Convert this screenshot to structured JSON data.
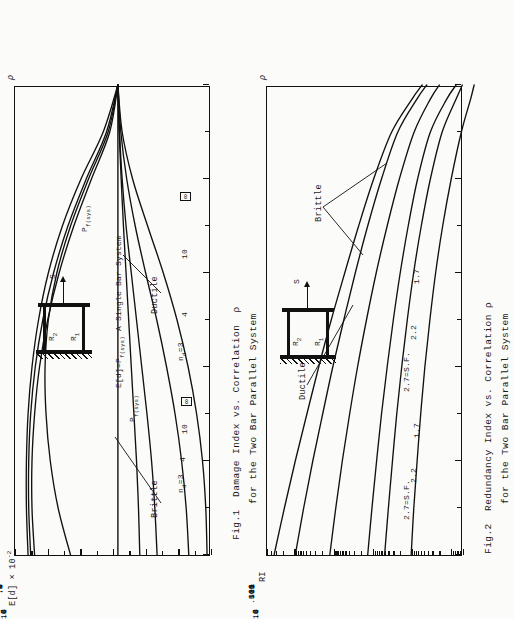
{
  "page": {
    "background_color": "#fbfbf9",
    "ink_color": "#111111",
    "orientation_note": "landscape-scan-rotated"
  },
  "fig1": {
    "caption_line1": "Fig.1  Damage Index vs. Correlation  ρ",
    "caption_line2": "for the Two Bar Parallel System",
    "y_axis_title": "E[d] × 10",
    "y_axis_exponent": "-2",
    "x_axis_title": "ρ",
    "y_ticks": [
      ".6",
      ".5",
      ".4",
      ".3",
      ".2",
      ".1",
      ".0"
    ],
    "x_ticks": [
      ".0",
      ".2",
      ".4",
      ".6",
      ".8",
      "1."
    ],
    "annotations": {
      "brittle": "Brittle",
      "ductile": "Ductile",
      "pf_sys": "P",
      "pf_sys_sub": "f(sys)",
      "single_bar": "E[d]=P",
      "single_bar_sub": "f(sys)",
      "single_bar_tail": "  A Single Bar System"
    },
    "curve_labels_upper": [
      "n",
      "4",
      "10",
      "∞"
    ],
    "curve_label_upper_first_sub": "d",
    "curve_label_upper_first_val": "=3",
    "curve_labels_lower": [
      "n",
      "4",
      "10",
      "∞"
    ],
    "curve_label_lower_first_sub": "d",
    "curve_label_lower_first_val": "=3"
  },
  "fig2": {
    "caption_line1": "Fig.2  Redundancy Index vs. Correlation ρ",
    "caption_line2": "for the Two Bar Parallel System",
    "y_axis_title": "RI",
    "x_axis_title": "ρ",
    "y_ticks": [
      "500",
      "100",
      "10",
      "1",
      ".1",
      ".01",
      ".005"
    ],
    "x_ticks": [
      ".0",
      ".2",
      ".4",
      ".6",
      ".8",
      "1."
    ],
    "annotations": {
      "brittle": "Brittle",
      "ductile": "Ductile"
    },
    "curve_labels_upper": [
      "2.7=S.F.",
      "2.2",
      "1.7"
    ],
    "curve_labels_lower": [
      "2.7=S.F.",
      "2.2",
      "1.7"
    ]
  },
  "sketch": {
    "label_r1": "R",
    "label_r1_sub": "1",
    "label_r2": "R",
    "label_r2_sub": "2",
    "label_s": "S"
  },
  "chart_data": [
    {
      "type": "line",
      "id": "fig1",
      "title": "Damage Index vs. Correlation ρ for the Two Bar Parallel System",
      "xlabel": "ρ",
      "ylabel": "E[d] × 10^-2",
      "xlim": [
        0.0,
        1.0
      ],
      "ylim": [
        0.0,
        0.6
      ],
      "grid": false,
      "legend": "inline-labels",
      "xticks": [
        0.0,
        0.2,
        0.4,
        0.6,
        0.8,
        1.0
      ],
      "yticks": [
        0.0,
        0.1,
        0.2,
        0.3,
        0.4,
        0.5,
        0.6
      ],
      "reference_line": {
        "label": "E[d]=P_f(sys)  A Single Bar System",
        "y": 0.285
      },
      "series": [
        {
          "name": "Brittle n_d=3",
          "group": "brittle",
          "x": [
            0.0,
            0.1,
            0.2,
            0.3,
            0.4,
            0.5,
            0.6,
            0.7,
            0.8,
            0.9,
            1.0
          ],
          "y": [
            0.56,
            0.565,
            0.565,
            0.56,
            0.548,
            0.528,
            0.498,
            0.455,
            0.398,
            0.33,
            0.285
          ]
        },
        {
          "name": "Brittle n_d=4",
          "group": "brittle",
          "x": [
            0.0,
            0.1,
            0.2,
            0.3,
            0.4,
            0.5,
            0.6,
            0.7,
            0.8,
            0.9,
            1.0
          ],
          "y": [
            0.552,
            0.558,
            0.558,
            0.552,
            0.538,
            0.515,
            0.482,
            0.438,
            0.382,
            0.32,
            0.285
          ]
        },
        {
          "name": "Brittle n_d=10",
          "group": "brittle",
          "x": [
            0.0,
            0.1,
            0.2,
            0.3,
            0.4,
            0.5,
            0.6,
            0.7,
            0.8,
            0.9,
            1.0
          ],
          "y": [
            0.54,
            0.548,
            0.548,
            0.54,
            0.525,
            0.5,
            0.465,
            0.42,
            0.366,
            0.31,
            0.285
          ]
        },
        {
          "name": "Brittle n_d=∞",
          "group": "brittle",
          "x": [
            0.0,
            0.1,
            0.2,
            0.3,
            0.4,
            0.5,
            0.6,
            0.7,
            0.8,
            0.9,
            1.0
          ],
          "y": [
            0.43,
            0.468,
            0.492,
            0.505,
            0.508,
            0.498,
            0.472,
            0.43,
            0.375,
            0.315,
            0.285
          ]
        },
        {
          "name": "Ductile n_d=3",
          "group": "ductile",
          "x": [
            0.0,
            0.1,
            0.2,
            0.3,
            0.4,
            0.5,
            0.6,
            0.7,
            0.8,
            0.9,
            1.0
          ],
          "y": [
            0.218,
            0.222,
            0.228,
            0.236,
            0.244,
            0.252,
            0.26,
            0.268,
            0.275,
            0.281,
            0.285
          ]
        },
        {
          "name": "Ductile n_d=4",
          "group": "ductile",
          "x": [
            0.0,
            0.1,
            0.2,
            0.3,
            0.4,
            0.5,
            0.6,
            0.7,
            0.8,
            0.9,
            1.0
          ],
          "y": [
            0.165,
            0.172,
            0.182,
            0.196,
            0.212,
            0.228,
            0.244,
            0.26,
            0.272,
            0.28,
            0.285
          ]
        },
        {
          "name": "Ductile n_d=10",
          "group": "ductile",
          "x": [
            0.0,
            0.1,
            0.2,
            0.3,
            0.4,
            0.5,
            0.6,
            0.7,
            0.8,
            0.9,
            1.0
          ],
          "y": [
            0.068,
            0.076,
            0.09,
            0.11,
            0.136,
            0.166,
            0.2,
            0.232,
            0.258,
            0.276,
            0.285
          ]
        },
        {
          "name": "Ductile n_d=∞",
          "group": "ductile",
          "x": [
            0.0,
            0.1,
            0.2,
            0.3,
            0.4,
            0.5,
            0.6,
            0.7,
            0.8,
            0.9,
            1.0
          ],
          "y": [
            0.012,
            0.016,
            0.026,
            0.044,
            0.07,
            0.104,
            0.146,
            0.194,
            0.24,
            0.272,
            0.285
          ]
        }
      ]
    },
    {
      "type": "line",
      "id": "fig2",
      "title": "Redundancy Index vs. Correlation ρ for the Two Bar Parallel System",
      "xlabel": "ρ",
      "ylabel": "RI",
      "yscale": "log",
      "xlim": [
        0.0,
        1.0
      ],
      "ylim": [
        0.005,
        500
      ],
      "grid": false,
      "legend": "inline-labels",
      "xticks": [
        0.0,
        0.2,
        0.4,
        0.6,
        0.8,
        1.0
      ],
      "yticks": [
        0.005,
        0.01,
        0.1,
        1,
        10,
        100,
        500
      ],
      "series": [
        {
          "name": "Ductile 2.7=S.F.",
          "group": "ductile",
          "x": [
            0.0,
            0.1,
            0.2,
            0.3,
            0.4,
            0.5,
            0.6,
            0.7,
            0.8,
            0.9,
            0.97,
            1.0
          ],
          "y": [
            330,
            180,
            95,
            48,
            24,
            11.5,
            5.2,
            2.3,
            0.95,
            0.33,
            0.1,
            0.055
          ]
        },
        {
          "name": "Ductile 2.2",
          "group": "ductile",
          "x": [
            0.0,
            0.1,
            0.2,
            0.3,
            0.4,
            0.5,
            0.6,
            0.7,
            0.8,
            0.9,
            0.97,
            1.0
          ],
          "y": [
            95,
            58,
            34,
            19,
            10.5,
            5.5,
            2.8,
            1.35,
            0.6,
            0.23,
            0.075,
            0.042
          ]
        },
        {
          "name": "Ductile 1.7",
          "group": "ductile",
          "x": [
            0.0,
            0.1,
            0.2,
            0.3,
            0.4,
            0.5,
            0.6,
            0.7,
            0.8,
            0.9,
            0.97,
            1.0
          ],
          "y": [
            12.5,
            8.8,
            6.0,
            3.9,
            2.45,
            1.45,
            0.82,
            0.43,
            0.21,
            0.088,
            0.034,
            0.02
          ]
        },
        {
          "name": "Brittle 2.7=S.F.",
          "group": "brittle",
          "x": [
            0.0,
            0.1,
            0.2,
            0.3,
            0.4,
            0.5,
            0.6,
            0.7,
            0.8,
            0.9,
            0.97,
            1.0
          ],
          "y": [
            1.35,
            1.05,
            0.8,
            0.6,
            0.43,
            0.3,
            0.2,
            0.125,
            0.072,
            0.034,
            0.013,
            0.0075
          ]
        },
        {
          "name": "Brittle 2.2",
          "group": "brittle",
          "x": [
            0.0,
            0.1,
            0.2,
            0.3,
            0.4,
            0.5,
            0.6,
            0.7,
            0.8,
            0.9,
            0.97,
            1.0
          ],
          "y": [
            0.5,
            0.4,
            0.315,
            0.245,
            0.183,
            0.132,
            0.091,
            0.058,
            0.034,
            0.017,
            0.0075,
            0.0052
          ]
        },
        {
          "name": "Brittle 1.7",
          "group": "brittle",
          "x": [
            0.0,
            0.1,
            0.2,
            0.3,
            0.4,
            0.5,
            0.6,
            0.7,
            0.8,
            0.9,
            0.97,
            1.0
          ],
          "y": [
            0.105,
            0.09,
            0.074,
            0.06,
            0.047,
            0.035,
            0.025,
            0.0165,
            0.01,
            0.0055,
            0.0032,
            0.0026
          ]
        }
      ]
    }
  ]
}
